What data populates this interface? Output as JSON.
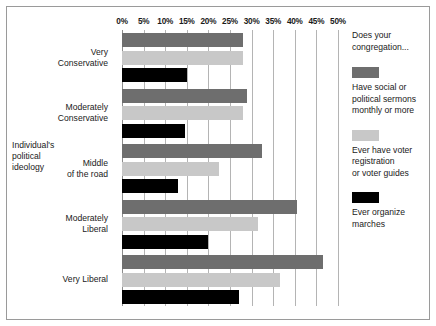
{
  "chart_data": {
    "type": "bar",
    "orientation": "horizontal",
    "title": "",
    "xlabel": "",
    "ylabel": "Individual's\npolitical\nideology",
    "xlim": [
      0,
      50
    ],
    "xtick_labels": [
      "0%",
      "5%",
      "10%",
      "15%",
      "20%",
      "25%",
      "30%",
      "35%",
      "40%",
      "45%",
      "50%"
    ],
    "xtick_values": [
      0,
      5,
      10,
      15,
      20,
      25,
      30,
      35,
      40,
      45,
      50
    ],
    "grid": true,
    "grid_axis": "x",
    "legend_position": "right",
    "legend_title": "Does your\ncongregation...",
    "categories": [
      "Very\nConservative",
      "Moderately\nConservative",
      "Middle\nof the road",
      "Moderately\nLiberal",
      "Very Liberal"
    ],
    "series": [
      {
        "name": "Have social or\npolitical sermons\nmonthly or more",
        "color": "#6e6e6e",
        "values": [
          28,
          29,
          32.5,
          40.5,
          46.5
        ]
      },
      {
        "name": "Ever have voter\nregistration\nor voter guides",
        "color": "#c8c8c8",
        "values": [
          28,
          28,
          22.5,
          31.5,
          36.5
        ]
      },
      {
        "name": "Ever organize\nmarches",
        "color": "#000000",
        "values": [
          15,
          14.5,
          13,
          20,
          27
        ]
      }
    ]
  },
  "figure": {
    "background_color": "#ffffff",
    "border_color": "#9a9a9a",
    "gridline_color": "#b4b4b4"
  }
}
